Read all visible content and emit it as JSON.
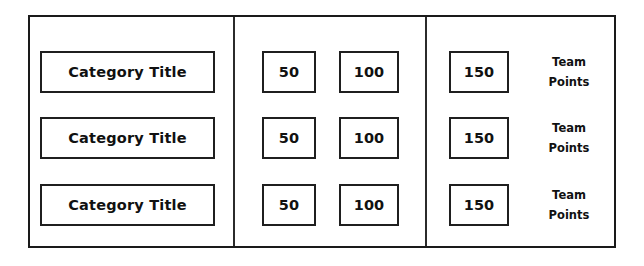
{
  "board": {
    "name": "jeopardy-style-scoreboard",
    "frame_color": "#1a1a1a",
    "background_color": "#ffffff",
    "divider_color": "#2b2b2b",
    "text_color": "#111111"
  },
  "rows": [
    {
      "category": "Category Title",
      "values": [
        "50",
        "100",
        "150"
      ],
      "team_label_line1": "Team",
      "team_label_line2": "Points"
    },
    {
      "category": "Category Title",
      "values": [
        "50",
        "100",
        "150"
      ],
      "team_label_line1": "Team",
      "team_label_line2": "Points"
    },
    {
      "category": "Category Title",
      "values": [
        "50",
        "100",
        "150"
      ],
      "team_label_line1": "Team",
      "team_label_line2": "Points"
    }
  ]
}
